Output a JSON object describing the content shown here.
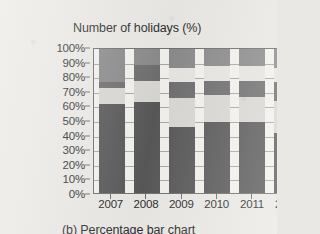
{
  "chart_data": {
    "type": "bar",
    "subtype": "percentage-stacked",
    "title": "Number of holidays (%)",
    "caption": "(b) Percentage bar chart",
    "xlabel": "",
    "ylabel": "",
    "ylim": [
      0,
      100
    ],
    "grid": true,
    "legend": "none",
    "categories": [
      "2007",
      "2008",
      "2009",
      "2010",
      "2011",
      "2012"
    ],
    "y_ticks": [
      "0%",
      "10%",
      "20%",
      "30%",
      "40%",
      "50%",
      "60%",
      "70%",
      "80%",
      "90%",
      "100%"
    ],
    "y_tick_values": [
      0,
      10,
      20,
      30,
      40,
      50,
      60,
      70,
      80,
      90,
      100
    ],
    "series": [
      {
        "name": "segment-1",
        "color": "#585858",
        "values": [
          62,
          63,
          46,
          49,
          49,
          42
        ]
      },
      {
        "name": "segment-2",
        "color": "#d8d7d3",
        "values": [
          11,
          15,
          20,
          19,
          18,
          22
        ]
      },
      {
        "name": "segment-3",
        "color": "#6e6e6e",
        "values": [
          4,
          11,
          11,
          10,
          11,
          13
        ]
      },
      {
        "name": "segment-4",
        "color": "#e6e5e1",
        "values": [
          0,
          0,
          10,
          10,
          10,
          10
        ]
      },
      {
        "name": "segment-5",
        "color": "#8a8a8a",
        "values": [
          23,
          11,
          13,
          12,
          12,
          13
        ]
      }
    ],
    "stacks": [
      {
        "category": "2007",
        "segments": [
          62,
          11,
          4,
          0,
          23
        ]
      },
      {
        "category": "2008",
        "segments": [
          63,
          15,
          11,
          0,
          11
        ]
      },
      {
        "category": "2009",
        "segments": [
          46,
          20,
          11,
          10,
          13
        ]
      },
      {
        "category": "2010",
        "segments": [
          49,
          19,
          10,
          10,
          12
        ]
      },
      {
        "category": "2011",
        "segments": [
          49,
          18,
          11,
          10,
          12
        ]
      },
      {
        "category": "2012",
        "segments": [
          42,
          22,
          13,
          10,
          13
        ]
      }
    ],
    "colors": {
      "segment_1": "#585858",
      "segment_2": "#d8d7d3",
      "segment_3": "#6e6e6e",
      "segment_4": "#e6e5e1",
      "segment_5": "#8a8a8a",
      "plot_background": "#f2f1ee",
      "axis": "#6f6f6f",
      "gridline": "#a9a8a4",
      "page_background": "#e9e8e4",
      "text": "#2b2b2b"
    }
  }
}
